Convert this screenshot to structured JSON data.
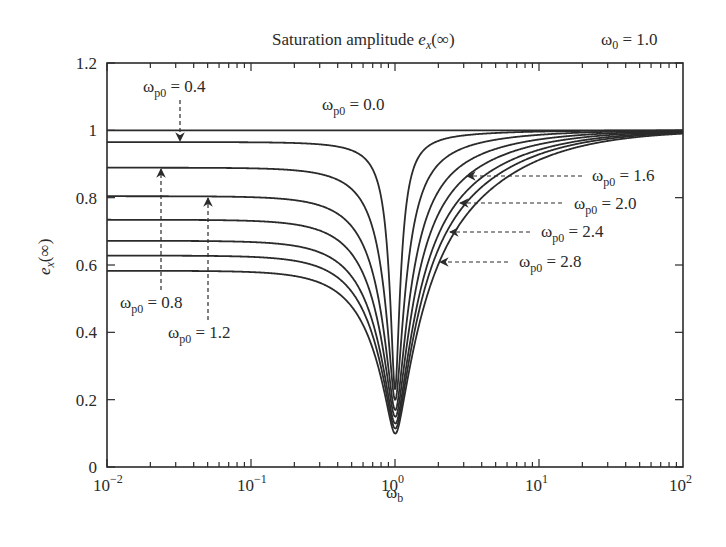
{
  "chart_data": {
    "type": "line",
    "title_main": "Saturation amplitude ",
    "title_symbol": "e",
    "title_sub": "x",
    "title_tail": "(∞)",
    "annotation_top_right": "ω0 = 1.0",
    "annotation_top_right_parts": {
      "omega": "ω",
      "sub": "0",
      "rest": " = 1.0"
    },
    "xlabel": "ω_b",
    "xlabel_parts": {
      "omega": "ω",
      "sub": "b"
    },
    "ylabel": "e_x(∞)",
    "ylabel_parts": {
      "symbol": "e",
      "sub": "x",
      "tail": "(∞)"
    },
    "xscale": "log",
    "xlim": [
      0.01,
      100
    ],
    "ylim": [
      0,
      1.2
    ],
    "x_ticks": [
      {
        "base": "10",
        "exp": "−2",
        "value": 0.01
      },
      {
        "base": "10",
        "exp": "−1",
        "value": 0.1
      },
      {
        "base": "10",
        "exp": "0",
        "value": 1
      },
      {
        "base": "10",
        "exp": "1",
        "value": 10
      },
      {
        "base": "10",
        "exp": "2",
        "value": 100
      }
    ],
    "y_ticks": [
      {
        "label": "0",
        "value": 0
      },
      {
        "label": "0.2",
        "value": 0.2
      },
      {
        "label": "0.4",
        "value": 0.4
      },
      {
        "label": "0.6",
        "value": 0.6
      },
      {
        "label": "0.8",
        "value": 0.8
      },
      {
        "label": "1",
        "value": 1.0
      },
      {
        "label": "1.2",
        "value": 1.2
      }
    ],
    "grid": false,
    "legend": "none (inline arrow labels)",
    "series": [
      {
        "name": "ωp0 = 0.0",
        "low_freq_value": 1.0,
        "min_value_at_wb_1": 1.0,
        "values_sample": {
          "0.01": 1.0,
          "1": 1.0,
          "100": 1.0
        }
      },
      {
        "name": "ωp0 = 0.4",
        "low_freq_value": 0.965,
        "min_value_at_wb_1": 0.23,
        "values_sample": {
          "0.01": 0.965,
          "0.1": 0.96,
          "0.5": 0.9,
          "1": 0.23,
          "2": 0.99,
          "100": 1.0
        }
      },
      {
        "name": "ωp0 = 0.8",
        "low_freq_value": 0.888,
        "min_value_at_wb_1": 0.2,
        "values_sample": {
          "0.01": 0.888,
          "0.1": 0.88,
          "0.5": 0.72,
          "1": 0.2,
          "2": 0.95,
          "100": 1.0
        }
      },
      {
        "name": "ωp0 = 1.2",
        "low_freq_value": 0.802,
        "min_value_at_wb_1": 0.17,
        "values_sample": {
          "0.01": 0.802,
          "0.1": 0.79,
          "0.5": 0.6,
          "1": 0.17,
          "2": 0.88,
          "100": 1.0
        }
      },
      {
        "name": "ωp0 = 1.6",
        "low_freq_value": 0.731,
        "min_value_at_wb_1": 0.15,
        "values_sample": {
          "0.01": 0.731,
          "0.1": 0.72,
          "0.5": 0.53,
          "1": 0.15,
          "3.2": 0.87,
          "100": 1.0
        }
      },
      {
        "name": "ωp0 = 2.0",
        "low_freq_value": 0.668,
        "min_value_at_wb_1": 0.13,
        "values_sample": {
          "0.01": 0.668,
          "0.1": 0.66,
          "0.5": 0.48,
          "1": 0.13,
          "2.8": 0.8,
          "100": 1.0
        }
      },
      {
        "name": "ωp0 = 2.4",
        "low_freq_value": 0.624,
        "min_value_at_wb_1": 0.115,
        "values_sample": {
          "0.01": 0.624,
          "0.1": 0.61,
          "0.5": 0.44,
          "1": 0.115,
          "2.4": 0.72,
          "100": 1.0
        }
      },
      {
        "name": "ωp0 = 2.8",
        "low_freq_value": 0.579,
        "min_value_at_wb_1": 0.1,
        "values_sample": {
          "0.01": 0.579,
          "0.1": 0.57,
          "0.5": 0.41,
          "1": 0.1,
          "2.05": 0.61,
          "100": 1.0
        }
      }
    ],
    "labels": [
      {
        "text_omega": "ω",
        "text_sub": "p0",
        "text_rest": " = 0.0",
        "series": "ωp0 = 0.0",
        "pos": [
          322,
          110
        ],
        "arrow": null
      },
      {
        "text_omega": "ω",
        "text_sub": "p0",
        "text_rest": " = 0.4",
        "series": "ωp0 = 0.4",
        "pos": [
          143,
          92
        ],
        "arrow": {
          "from": [
            180,
            100
          ],
          "to": [
            180,
            141
          ]
        }
      },
      {
        "text_omega": "ω",
        "text_sub": "p0",
        "text_rest": " = 0.8",
        "series": "ωp0 = 0.8",
        "pos": [
          120,
          308
        ],
        "arrow": {
          "from": [
            161,
            290
          ],
          "to": [
            161,
            169
          ]
        }
      },
      {
        "text_omega": "ω",
        "text_sub": "p0",
        "text_rest": " = 1.2",
        "series": "ωp0 = 1.2",
        "pos": [
          168,
          338
        ],
        "arrow": {
          "from": [
            208,
            320
          ],
          "to": [
            208,
            198
          ]
        }
      },
      {
        "text_omega": "ω",
        "text_sub": "p0",
        "text_rest": " = 1.6",
        "series": "ωp0 = 1.6",
        "pos": [
          592,
          181
        ],
        "arrow": {
          "from": [
            582,
            176
          ],
          "to": [
            467,
            176
          ]
        }
      },
      {
        "text_omega": "ω",
        "text_sub": "p0",
        "text_rest": " = 2.0",
        "series": "ωp0 = 2.0",
        "pos": [
          574,
          209
        ],
        "arrow": {
          "from": [
            562,
            203
          ],
          "to": [
            460,
            203
          ]
        }
      },
      {
        "text_omega": "ω",
        "text_sub": "p0",
        "text_rest": " = 2.4",
        "series": "ωp0 = 2.4",
        "pos": [
          541,
          237
        ],
        "arrow": {
          "from": [
            530,
            232
          ],
          "to": [
            450,
            232
          ]
        }
      },
      {
        "text_omega": "ω",
        "text_sub": "p0",
        "text_rest": " = 2.8",
        "series": "ωp0 = 2.8",
        "pos": [
          519,
          267
        ],
        "arrow": {
          "from": [
            508,
            262
          ],
          "to": [
            440,
            262
          ]
        }
      }
    ],
    "colors": {
      "line": "#2b2b2b",
      "axis": "#2b2b2b",
      "text": "#2a2a2a",
      "background": "#ffffff"
    }
  },
  "layout": {
    "plot": {
      "left": 107,
      "top": 63,
      "right": 683,
      "bottom": 467
    }
  }
}
